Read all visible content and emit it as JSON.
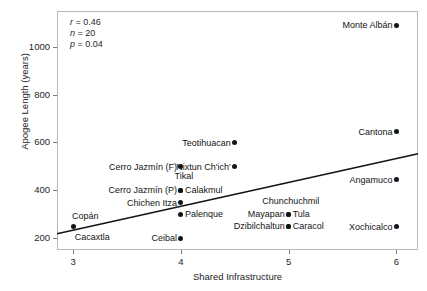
{
  "chart_data": {
    "type": "scatter",
    "title": "",
    "xlabel": "Shared Infrastructure",
    "ylabel": "Apogee Length (years)",
    "xlim": [
      2.85,
      6.2
    ],
    "ylim": [
      150,
      1150
    ],
    "xticks": [
      "3",
      "4",
      "5",
      "6"
    ],
    "xtick_values": [
      3,
      4,
      5,
      6
    ],
    "yticks": [
      "200",
      "400",
      "600",
      "800",
      "1000"
    ],
    "ytick_values": [
      200,
      400,
      600,
      800,
      1000
    ],
    "grid": false,
    "legend": "none",
    "annotations": {
      "r_label": "r",
      "r_value": "= 0.46",
      "n_label": "n",
      "n_value": "= 20",
      "p_label": "p",
      "p_value": "= 0.04"
    },
    "statistics": {
      "r": 0.46,
      "n": 20,
      "p": 0.04
    },
    "trendline": {
      "type": "linear",
      "x": [
        2.85,
        6.2
      ],
      "y": [
        218,
        553
      ],
      "color": "#141414"
    },
    "points": [
      {
        "label": "Monte Albán",
        "x": 6.0,
        "y": 1090,
        "side": "l"
      },
      {
        "label": "Cantona",
        "x": 6.0,
        "y": 645,
        "side": "l"
      },
      {
        "label": "Teotihuacan",
        "x": 4.5,
        "y": 598,
        "side": "l"
      },
      {
        "label": "Nixtun Ch'ich'",
        "x": 4.5,
        "y": 498,
        "side": "l"
      },
      {
        "label": "Cerro Jazmín (F)",
        "x": 4.0,
        "y": 498,
        "side": "l"
      },
      {
        "label": "Angamuco",
        "x": 6.0,
        "y": 443,
        "side": "l"
      },
      {
        "label": "Tikal",
        "x": 4.0,
        "y": 400,
        "side": "tikal"
      },
      {
        "label": "Cerro Jazmín (P)",
        "x": 4.0,
        "y": 400,
        "side": "l"
      },
      {
        "label": "Calakmul",
        "x": 4.0,
        "y": 400,
        "side": "r"
      },
      {
        "label": "Chichen Itza",
        "x": 4.0,
        "y": 347,
        "side": "l"
      },
      {
        "label": "Chunchuchmil",
        "x": 5.0,
        "y": 300,
        "side": "chunch"
      },
      {
        "label": "Palenque",
        "x": 4.0,
        "y": 300,
        "side": "r"
      },
      {
        "label": "Mayapan",
        "x": 5.0,
        "y": 300,
        "side": "l"
      },
      {
        "label": "Tula",
        "x": 5.0,
        "y": 300,
        "side": "r"
      },
      {
        "label": "Dzibilchaltun",
        "x": 5.0,
        "y": 250,
        "side": "l"
      },
      {
        "label": "Caracol",
        "x": 5.0,
        "y": 250,
        "side": "r"
      },
      {
        "label": "Xochicalco",
        "x": 6.0,
        "y": 248,
        "side": "l"
      },
      {
        "label": "Copán",
        "x": 3.0,
        "y": 250,
        "side": "above"
      },
      {
        "label": "Cacaxtla",
        "x": 3.0,
        "y": 250,
        "side": "below"
      },
      {
        "label": "Ceibal",
        "x": 4.0,
        "y": 200,
        "side": "l"
      }
    ]
  }
}
